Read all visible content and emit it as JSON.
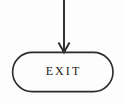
{
  "diagram": {
    "type": "flowchart",
    "background_color": "#fdfdfd",
    "stroke_color": "#2b2b2b",
    "text_color": "#222222",
    "nodes": [
      {
        "id": "exit-terminator",
        "shape": "stadium",
        "role": "terminator",
        "label": "EXIT",
        "x": 12,
        "y": 52,
        "width": 101,
        "height": 40,
        "fill": "none",
        "stroke": "#2b2b2b",
        "stroke_width": 1.6
      }
    ],
    "connectors": [
      {
        "id": "incoming-arrow",
        "kind": "arrow",
        "direction": "down",
        "from_x": 64,
        "from_y": 0,
        "to_x": 64,
        "to_y": 52,
        "stroke": "#2b2b2b",
        "stroke_width": 1.8,
        "arrowhead": {
          "style": "open-v",
          "width": 11,
          "height": 11
        }
      }
    ],
    "label_position": {
      "center_x": 63,
      "center_y": 71
    }
  }
}
